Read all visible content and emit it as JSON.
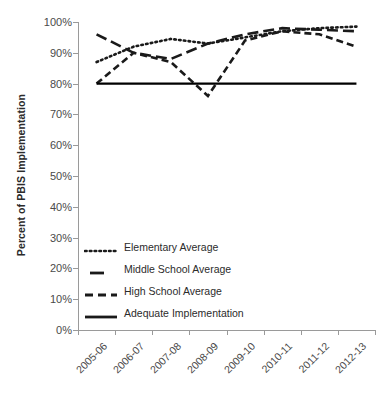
{
  "chart_data": {
    "type": "line",
    "title": "",
    "xlabel": "",
    "ylabel": "Percent of PBIS Implementation",
    "categories": [
      "2005-06",
      "2006-07",
      "2007-08",
      "2008-09",
      "2009-10",
      "2010-11",
      "2011-12",
      "2012-13"
    ],
    "ylim": [
      0,
      100
    ],
    "ytick_labels": [
      "0%",
      "10%",
      "20%",
      "30%",
      "40%",
      "50%",
      "60%",
      "70%",
      "80%",
      "90%",
      "100%"
    ],
    "ytick_values": [
      0,
      10,
      20,
      30,
      40,
      50,
      60,
      70,
      80,
      90,
      100
    ],
    "grid": false,
    "legend_position": "inside-lower-left",
    "series": [
      {
        "name": "Elementary Average",
        "style": "dotted",
        "color": "#1a1a1a",
        "values": [
          87,
          92,
          94.5,
          93,
          95,
          97,
          98,
          98.5
        ]
      },
      {
        "name": "Middle School Average",
        "style": "long-dash",
        "color": "#1a1a1a",
        "values": [
          96,
          90,
          88,
          93,
          96,
          98,
          97.5,
          97
        ]
      },
      {
        "name": "High School Average",
        "style": "short-dash",
        "color": "#1a1a1a",
        "values": [
          80,
          90,
          87,
          76,
          94,
          97,
          96,
          92
        ]
      },
      {
        "name": "Adequate Implementation",
        "style": "solid",
        "color": "#000000",
        "values": [
          80,
          80,
          80,
          80,
          80,
          80,
          80,
          80
        ]
      }
    ]
  },
  "legend": {
    "items": [
      {
        "label": "Elementary Average",
        "style": "dotted"
      },
      {
        "label": "Middle School Average",
        "style": "long-dash"
      },
      {
        "label": "High School Average",
        "style": "short-dash"
      },
      {
        "label": "Adequate Implementation",
        "style": "solid"
      }
    ]
  }
}
